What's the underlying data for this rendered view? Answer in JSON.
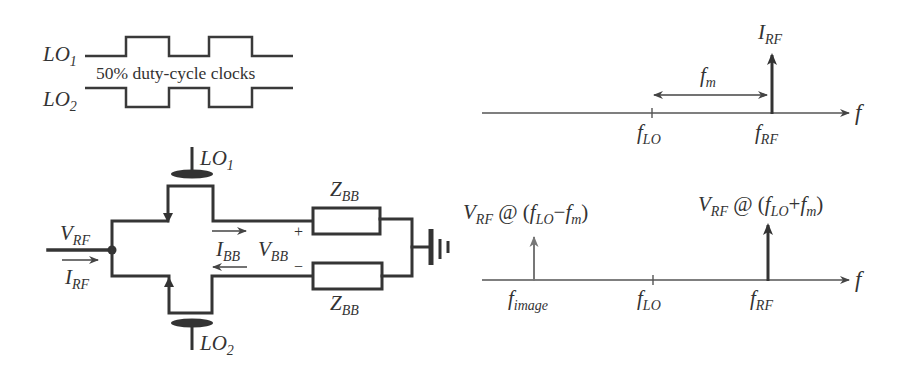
{
  "clocks": {
    "lo1": {
      "main": "LO",
      "sub": "1"
    },
    "lo2": {
      "main": "LO",
      "sub": "2"
    },
    "caption": "50% duty-cycle clocks"
  },
  "circuit": {
    "lo1_gate": {
      "main": "LO",
      "sub": "1"
    },
    "lo2_gate": {
      "main": "LO",
      "sub": "2"
    },
    "v_rf": {
      "main": "V",
      "sub": "RF"
    },
    "i_rf": {
      "main": "I",
      "sub": "RF"
    },
    "i_bb": {
      "main": "I",
      "sub": "BB"
    },
    "v_bb": {
      "main": "V",
      "sub": "BB"
    },
    "plus": "+",
    "minus": "−",
    "z_bb_top": {
      "main": "Z",
      "sub": "BB"
    },
    "z_bb_bottom": {
      "main": "Z",
      "sub": "BB"
    }
  },
  "spectrum_top": {
    "axis_label": "f",
    "spike_label": {
      "main": "I",
      "sub": "RF"
    },
    "offset_label": {
      "main": "f",
      "sub": "m"
    },
    "tick_lo": {
      "main": "f",
      "sub": "LO"
    },
    "tick_rf": {
      "main": "f",
      "sub": "RF"
    }
  },
  "spectrum_bottom": {
    "axis_label": "f",
    "image_label": {
      "v": "V",
      "v_sub": "RF",
      "at": " @ (",
      "f1": "f",
      "f1_sub": "LO",
      "op": "−",
      "f2": "f",
      "f2_sub": "m",
      "close": ")"
    },
    "rf_label": {
      "v": "V",
      "v_sub": "RF",
      "at": " @ (",
      "f1": "f",
      "f1_sub": "LO",
      "op": "+",
      "f2": "f",
      "f2_sub": "m",
      "close": ")"
    },
    "tick_image": {
      "main": "f",
      "sub": "image"
    },
    "tick_lo": {
      "main": "f",
      "sub": "LO"
    },
    "tick_rf": {
      "main": "f",
      "sub": "RF"
    }
  },
  "colors": {
    "stroke": "#353535",
    "axis": "#555555",
    "image_spike": "#777777"
  }
}
